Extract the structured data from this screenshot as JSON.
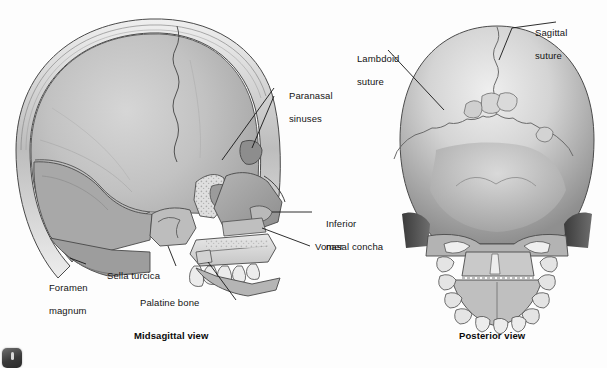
{
  "figure": {
    "background_color": "#fdfdfd",
    "style": "grayscale medical illustration"
  },
  "panels": [
    {
      "id": "midsagittal",
      "caption": "Midsagittal view",
      "labels": [
        {
          "id": "paranasal-sinuses",
          "text": "Paranasal\nsinuses",
          "line1": "Paranasal",
          "line2": "sinuses"
        },
        {
          "id": "inferior-nasal-concha",
          "text": "Inferior\nnasal concha",
          "line1": "Inferior",
          "line2": "nasal concha"
        },
        {
          "id": "vomer",
          "text": "Vomer",
          "line1": "Vomer",
          "line2": ""
        },
        {
          "id": "foramen-magnum",
          "text": "Foramen\nmagnum",
          "line1": "Foramen",
          "line2": "magnum"
        },
        {
          "id": "sella-turcica",
          "text": "Sella turcica",
          "line1": "Sella turcica",
          "line2": ""
        },
        {
          "id": "palatine-bone",
          "text": "Palatine bone",
          "line1": "Palatine bone",
          "line2": ""
        }
      ]
    },
    {
      "id": "posterior",
      "caption": "Posterior view",
      "labels": [
        {
          "id": "lambdoid-suture",
          "text": "Lambdoid\nsuture",
          "line1": "Lambdoid",
          "line2": "suture"
        },
        {
          "id": "sagittal-suture",
          "text": "Sagittal\nsuture",
          "line1": "Sagittal",
          "line2": "suture"
        }
      ]
    }
  ],
  "colors": {
    "bone_light": "#e6e6e6",
    "bone_mid": "#c7c7c7",
    "bone_dark": "#9a9a9a",
    "bone_shadow": "#6e6e6e",
    "outline": "#3d3d3d",
    "leader": "#1a1a1a",
    "text": "#141414",
    "background": "#fdfdfd"
  },
  "corner_icon": {
    "name": "app-icon",
    "visible": true,
    "cropped": true
  }
}
